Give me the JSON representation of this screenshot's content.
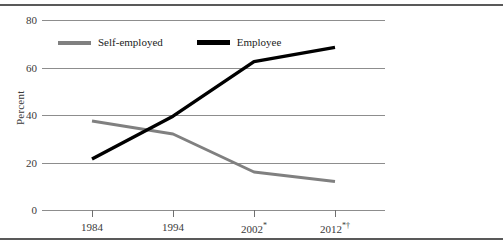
{
  "chart_data": {
    "type": "line",
    "title": "",
    "subtitle": "",
    "xlabel": "",
    "ylabel": "Percent",
    "x": [
      "1984",
      "1994",
      "2002*",
      "2012*†"
    ],
    "categories": [
      "1984",
      "1994",
      "2002*",
      "2012*†"
    ],
    "xtick_labels": [
      {
        "base": "1984",
        "sup": ""
      },
      {
        "base": "1994",
        "sup": ""
      },
      {
        "base": "2002",
        "sup": "*"
      },
      {
        "base": "2012",
        "sup": "*†"
      }
    ],
    "ylim": [
      0,
      80
    ],
    "yticks": [
      0,
      20,
      40,
      60,
      80
    ],
    "ytick_labels": [
      "0",
      "20",
      "40",
      "60",
      "80"
    ],
    "grid": "horizontal",
    "legend_position": "upper-left-inside",
    "series": [
      {
        "name": "Self-employed",
        "color": "#808080",
        "values": [
          37.5,
          32.0,
          16.0,
          12.0
        ]
      },
      {
        "name": "Employee",
        "color": "#000000",
        "values": [
          21.5,
          39.5,
          62.5,
          68.5
        ]
      }
    ]
  },
  "legend": {
    "items": [
      {
        "label": "Self-employed",
        "color": "#808080"
      },
      {
        "label": "Employee",
        "color": "#000000"
      }
    ]
  },
  "axes": {
    "y_title": "Percent",
    "y_ticks": [
      "0",
      "20",
      "40",
      "60",
      "80"
    ]
  },
  "colors": {
    "self_employed": "#808080",
    "employee": "#000000",
    "gridline": "#8d8d8d",
    "rule": "#595959",
    "text": "#3a3a3a"
  }
}
